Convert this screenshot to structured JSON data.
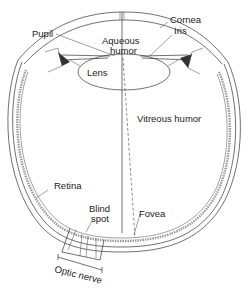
{
  "diagram": {
    "labels": {
      "pupil": "Pupil",
      "cornea": "Cornea",
      "iris": "Iris",
      "aqueous_line1": "Aqueous",
      "aqueous_line2": "humor",
      "lens": "Lens",
      "vitreous": "Vitreous humor",
      "retina": "Retina",
      "blind_line1": "Blind",
      "blind_line2": "spot",
      "fovea": "Fovea",
      "optic_nerve": "Optic nerve"
    },
    "colors": {
      "line": "#333333",
      "background": "#ffffff",
      "retina_fill": "#9a9a9a"
    }
  }
}
